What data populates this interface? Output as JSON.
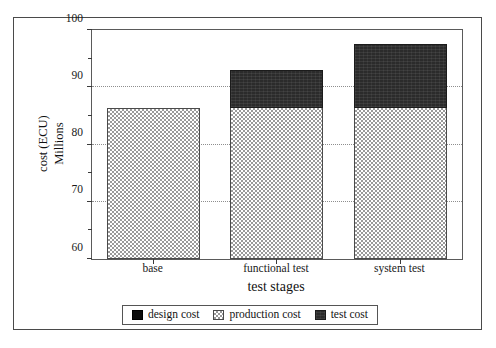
{
  "chart_data": {
    "type": "bar",
    "stacked": true,
    "title": "",
    "xlabel": "test stages",
    "ylabel": "cost (ECU) Millions",
    "ylabel_lines": [
      "cost (ECU)",
      "Millions"
    ],
    "categories": [
      "base",
      "functional test",
      "system test"
    ],
    "series": [
      {
        "name": "design cost",
        "values": [
          0,
          0,
          0
        ],
        "color": "#0c0c0c",
        "fill": "solid-black"
      },
      {
        "name": "production cost",
        "values": [
          86.4,
          86.4,
          86.4
        ],
        "color": "#9a9a9a",
        "fill": "checkerboard"
      },
      {
        "name": "test cost",
        "values": [
          0,
          6.6,
          11.1
        ],
        "color": "#2b2b2b",
        "fill": "dark-solid"
      }
    ],
    "totals": [
      86.4,
      93.0,
      97.5
    ],
    "ylim": [
      60,
      100
    ],
    "yticks": [
      60,
      70,
      80,
      90,
      100
    ],
    "ytick_labels": [
      "60",
      "70",
      "80",
      "90",
      "100"
    ],
    "yminor_ticks": [
      65,
      75,
      85,
      95
    ],
    "gridlines": [
      70,
      80,
      90
    ],
    "grid": true,
    "legend_position": "bottom"
  },
  "axes": {
    "y": {
      "ticks": [
        {
          "value": 100,
          "label": "100"
        },
        {
          "value": 95,
          "label": ""
        },
        {
          "value": 90,
          "label": "90"
        },
        {
          "value": 85,
          "label": ""
        },
        {
          "value": 80,
          "label": "80"
        },
        {
          "value": 75,
          "label": ""
        },
        {
          "value": 70,
          "label": "70"
        },
        {
          "value": 65,
          "label": ""
        },
        {
          "value": 60,
          "label": "60"
        }
      ]
    },
    "x": {
      "title": "test stages",
      "categories": [
        "base",
        "functional test",
        "system test"
      ]
    }
  },
  "legend": {
    "items": [
      {
        "label": "design cost",
        "swatch": "solid-black-swatch"
      },
      {
        "label": "production cost",
        "swatch": "checkerboard-swatch"
      },
      {
        "label": "test cost",
        "swatch": "dark-solid-swatch"
      }
    ]
  },
  "colors": {
    "design": "#0c0c0c",
    "production": "#9a9a9a",
    "test": "#2b2b2b",
    "frame": "#4a4a4a",
    "grid": "#8e8e8e",
    "background": "#ffffff"
  }
}
